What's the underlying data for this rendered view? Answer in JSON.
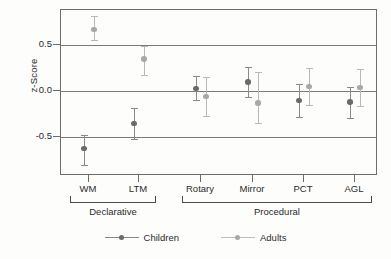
{
  "chart_data": {
    "type": "scatter",
    "title": "",
    "subtitle": "",
    "xlabel": "",
    "ylabel": "z-Score",
    "ylim": [
      -0.92,
      0.88
    ],
    "yticks": [
      0.5,
      0.0,
      -0.5
    ],
    "ytick_labels": [
      "0.5",
      "0.0",
      "-0.5"
    ],
    "grid": "horizontal gridlines at each y tick",
    "legend_position": "bottom-center",
    "error_bars": "vertical, symmetric (SEM)",
    "categories": [
      "WM",
      "LTM",
      "Rotary",
      "Mirror",
      "PCT",
      "AGL"
    ],
    "groups": [
      {
        "label": "Declarative",
        "categories": [
          "WM",
          "LTM"
        ]
      },
      {
        "label": "Procedural",
        "categories": [
          "Rotary",
          "Mirror",
          "PCT",
          "AGL"
        ]
      }
    ],
    "series": [
      {
        "name": "Children",
        "color": "#6a6a6a",
        "values": [
          -0.62,
          -0.35,
          0.03,
          0.1,
          -0.1,
          -0.12
        ],
        "err_low": [
          -0.8,
          -0.52,
          -0.1,
          -0.06,
          -0.28,
          -0.29
        ],
        "err_high": [
          -0.48,
          -0.18,
          0.16,
          0.26,
          0.08,
          0.05
        ]
      },
      {
        "name": "Adults",
        "color": "#a8a8a8",
        "values": [
          0.67,
          0.35,
          -0.06,
          -0.13,
          0.05,
          0.04
        ],
        "err_low": [
          0.55,
          0.18,
          -0.27,
          -0.34,
          -0.15,
          -0.16
        ],
        "err_high": [
          0.81,
          0.49,
          0.15,
          0.21,
          0.25,
          0.24
        ]
      }
    ]
  },
  "axis": {
    "ylabel": "z-Score",
    "yticks": [
      "0.5",
      "0.0",
      "-0.5"
    ]
  },
  "xaxis": {
    "labels": [
      "WM",
      "LTM",
      "Rotary",
      "Mirror",
      "PCT",
      "AGL"
    ]
  },
  "groups": {
    "declarative": "Declarative",
    "procedural": "Procedural"
  },
  "legend": {
    "children": "Children",
    "adults": "Adults"
  }
}
